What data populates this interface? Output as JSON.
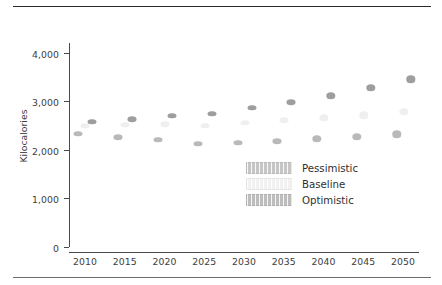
{
  "chart_data": {
    "type": "scatter",
    "title": "",
    "xlabel": "",
    "ylabel": "Kilocalories",
    "ylim": [
      0,
      4200
    ],
    "yticks": [
      0,
      1000,
      2000,
      3000,
      4000
    ],
    "ytick_labels": [
      "0",
      "1,000",
      "2,000",
      "3,000",
      "4,000"
    ],
    "xlim": [
      2008,
      2052
    ],
    "xticks": [
      2010,
      2015,
      2020,
      2025,
      2030,
      2035,
      2040,
      2045,
      2050
    ],
    "xtick_labels": [
      "2010",
      "2015",
      "2020",
      "2025",
      "2030",
      "2035",
      "2040",
      "2045",
      "2050"
    ],
    "grid": false,
    "legend_position": "lower right",
    "x": [
      2010,
      2015,
      2020,
      2025,
      2030,
      2035,
      2040,
      2045,
      2050
    ],
    "series": [
      {
        "name": "Pessimistic",
        "color": "#b9b9b9",
        "values": [
          2330,
          2265,
          2210,
          2125,
          2145,
          2180,
          2225,
          2265,
          2320
        ]
      },
      {
        "name": "Baseline",
        "color": "#efefef",
        "values": [
          2500,
          2515,
          2530,
          2500,
          2555,
          2605,
          2655,
          2715,
          2780
        ]
      },
      {
        "name": "Optimistic",
        "color": "#9e9e9e",
        "values": [
          2580,
          2630,
          2705,
          2745,
          2870,
          2985,
          3110,
          3280,
          3450
        ]
      }
    ]
  },
  "legend": {
    "items": [
      {
        "label": "Pessimistic",
        "key": "s-pessimistic"
      },
      {
        "label": "Baseline",
        "key": "s-baseline"
      },
      {
        "label": "Optimistic",
        "key": "s-optimistic"
      }
    ]
  },
  "colors": {
    "axis": "#4a4a4a",
    "text": "#3d3d3d",
    "rule_top": "#2b2b2b",
    "rule_bottom": "#6e6e6e"
  }
}
